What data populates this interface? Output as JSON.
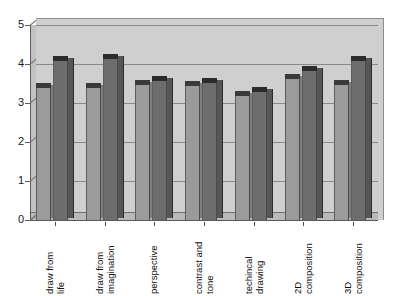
{
  "chart_data": {
    "type": "bar",
    "title": "",
    "subtitle": "",
    "xlabel": "",
    "ylabel": "",
    "ylim": [
      0,
      5
    ],
    "yticks": [
      0,
      1,
      2,
      3,
      4,
      5
    ],
    "ytick_labels": [
      "0",
      "1",
      "2",
      "3",
      "4",
      "5"
    ],
    "grid": true,
    "legend": "none",
    "style": "3d-clustered-column",
    "plot_background": "#cfcfcf",
    "categories": [
      "draw from life",
      "draw from imagination",
      "perspective",
      "contrast and tone",
      "techincal drawing",
      "2D composition",
      "3D composition"
    ],
    "category_lines": [
      [
        "draw from",
        "life"
      ],
      [
        "draw from",
        "imagination"
      ],
      [
        "perspective",
        ""
      ],
      [
        "contrast and",
        "tone"
      ],
      [
        "techincal",
        "drawing"
      ],
      [
        "2D",
        "composition"
      ],
      [
        "3D",
        "composition"
      ]
    ],
    "series": [
      {
        "name": "Series 1",
        "color": "#9b9b9b",
        "values": [
          3.4,
          3.4,
          3.5,
          3.45,
          3.2,
          3.65,
          3.5
        ]
      },
      {
        "name": "Series 2",
        "color": "#6d6d6d",
        "values": [
          4.1,
          4.15,
          3.6,
          3.55,
          3.3,
          3.85,
          4.1
        ]
      }
    ]
  }
}
